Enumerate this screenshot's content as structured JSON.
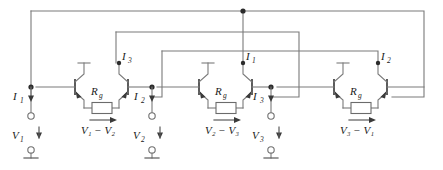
{
  "figure": {
    "type": "circuit-schematic",
    "title": "",
    "width": 443,
    "height": 170,
    "background_color": "#ffffff",
    "wire_color": "#7a7a7a",
    "label_color": "#1a1a1a"
  },
  "cells": [
    {
      "id": "cell-1",
      "resistor_label": "R",
      "resistor_subscript": "g",
      "voltage_label": "V",
      "voltage_sub_a": "1",
      "voltage_minus": "−",
      "voltage_sub_b": "2",
      "voltage_text": "V₁ − V₂",
      "collector_current_label": "I",
      "collector_current_subscript": "3"
    },
    {
      "id": "cell-2",
      "resistor_label": "R",
      "resistor_subscript": "g",
      "voltage_label": "V",
      "voltage_sub_a": "2",
      "voltage_minus": "−",
      "voltage_sub_b": "3",
      "voltage_text": "V₂ − V₃",
      "collector_current_label": "I",
      "collector_current_subscript": "1"
    },
    {
      "id": "cell-3",
      "resistor_label": "R",
      "resistor_subscript": "g",
      "voltage_label": "V",
      "voltage_sub_a": "3",
      "voltage_minus": "−",
      "voltage_sub_b": "1",
      "voltage_text": "V₃ − V₁",
      "collector_current_label": "I",
      "collector_current_subscript": "2"
    }
  ],
  "ports": [
    {
      "id": "port-1",
      "current_label": "I",
      "current_subscript": "1",
      "voltage_label": "V",
      "voltage_subscript": "1"
    },
    {
      "id": "port-2",
      "current_label": "I",
      "current_subscript": "2",
      "voltage_label": "V",
      "voltage_subscript": "2"
    },
    {
      "id": "port-3",
      "current_label": "I",
      "current_subscript": "3",
      "voltage_label": "V",
      "voltage_subscript": "3"
    }
  ],
  "components": {
    "transistor_count": 6,
    "resistor_count": 3,
    "ground_count": 3,
    "junction_dot_count": 8
  }
}
